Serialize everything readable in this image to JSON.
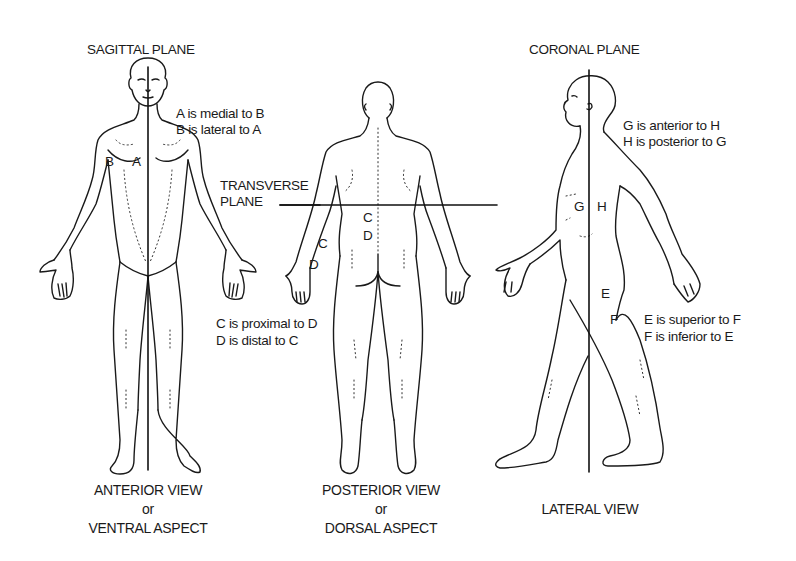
{
  "diagram": {
    "type": "anatomical-planes-and-directional-terms",
    "planes": {
      "sagittal": "SAGITTAL PLANE",
      "coronal": "CORONAL PLANE",
      "transverse_line1": "TRANSVERSE",
      "transverse_line2": "PLANE"
    },
    "figures": {
      "anterior": {
        "caption_line1": "ANTERIOR VIEW",
        "caption_line2": "or",
        "caption_line3": "VENTRAL ASPECT",
        "point_labels": {
          "a": "A",
          "b": "B"
        },
        "relation_line1": "A is medial to B",
        "relation_line2": "B is lateral to A"
      },
      "posterior": {
        "caption_line1": "POSTERIOR VIEW",
        "caption_line2": "or",
        "caption_line3": "DORSAL ASPECT",
        "point_labels": {
          "c_arm": "C",
          "d_arm": "D",
          "c_back": "C",
          "d_back": "D"
        },
        "relation_line1": "C is proximal to D",
        "relation_line2": "D is distal to C"
      },
      "lateral": {
        "caption_line1": "LATERAL VIEW",
        "point_labels": {
          "g": "G",
          "h": "H",
          "e": "E",
          "f": "F"
        },
        "relation_line1": "G is anterior to H",
        "relation_line2": "H is posterior to G",
        "relation_line3": "E is superior to F",
        "relation_line4": "F is inferior to E"
      }
    },
    "colors": {
      "ink": "#1a1a1a",
      "background": "#ffffff"
    }
  }
}
